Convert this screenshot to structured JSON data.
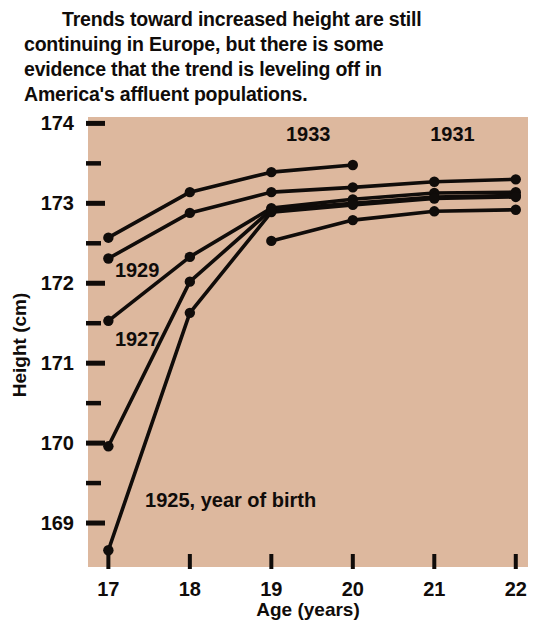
{
  "caption": {
    "lines": [
      "Trends toward increased height are still",
      "continuing in Europe, but there is some",
      "evidence that the trend is leveling off in",
      "America's affluent populations."
    ]
  },
  "colors": {
    "plot_background": "#ddb89e",
    "ink": "#100c0a",
    "page_background": "#ffffff"
  },
  "chart_data": {
    "type": "line",
    "title": "",
    "xlabel": "Age (years)",
    "ylabel": "Height (cm)",
    "xlim": [
      16.75,
      22.15
    ],
    "ylim": [
      168.45,
      174.08
    ],
    "xticks": [
      17,
      18,
      19,
      20,
      21,
      22
    ],
    "xtick_labels": [
      "17",
      "18",
      "19",
      "20",
      "21",
      "22"
    ],
    "yticks": [
      169,
      169.5,
      170,
      170.5,
      171,
      171.5,
      172,
      172.5,
      173,
      173.5,
      174
    ],
    "ytick_labels": [
      "169",
      "",
      "170",
      "",
      "171",
      "",
      "172",
      "",
      "173",
      "",
      "174"
    ],
    "ytick_major": [
      169,
      170,
      171,
      172,
      173,
      174
    ],
    "grid": false,
    "legend": "inline-annotations",
    "x": [
      17,
      18,
      19,
      20,
      21,
      22
    ],
    "series": [
      {
        "name": "1933",
        "label": "1933",
        "x": [
          17,
          18,
          19,
          20
        ],
        "values": [
          172.57,
          173.14,
          173.39,
          173.48
        ]
      },
      {
        "name": "1931",
        "label": "1931",
        "x": [
          17,
          18,
          19,
          20,
          21,
          22
        ],
        "values": [
          172.31,
          172.88,
          173.14,
          173.2,
          173.27,
          173.3
        ]
      },
      {
        "name": "1929",
        "label": "1929",
        "x": [
          17,
          18,
          19,
          20,
          21,
          22
        ],
        "values": [
          171.53,
          172.33,
          172.94,
          173.05,
          173.13,
          173.14
        ]
      },
      {
        "name": "1927",
        "label": "1927",
        "x": [
          17,
          18,
          19,
          20,
          21,
          22
        ],
        "values": [
          169.96,
          172.02,
          172.92,
          173.0,
          173.08,
          173.1
        ]
      },
      {
        "name": "1925",
        "label": "1925, year of birth",
        "x": [
          17,
          18,
          19,
          20,
          21,
          22
        ],
        "values": [
          168.66,
          171.63,
          172.89,
          172.98,
          173.06,
          173.08
        ]
      },
      {
        "name": "lowest",
        "label": "",
        "x": [
          19,
          20,
          21,
          22
        ],
        "values": [
          172.53,
          172.79,
          172.9,
          172.92
        ]
      }
    ],
    "annotations": [
      {
        "text": "1933",
        "x": 19.18,
        "y": 173.78
      },
      {
        "text": "1931",
        "x": 20.95,
        "y": 173.78
      },
      {
        "text": "1929",
        "x": 17.08,
        "y": 172.08
      },
      {
        "text": "1927",
        "x": 17.08,
        "y": 171.22
      },
      {
        "text": "1925, year of birth",
        "x": 17.45,
        "y": 169.2
      }
    ]
  }
}
